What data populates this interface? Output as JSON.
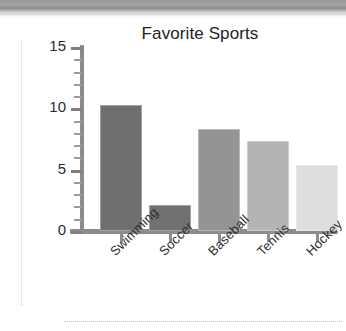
{
  "page": {
    "background_color": "#ffffff",
    "scan_band_color": "#9b9b9b"
  },
  "chart_data": {
    "type": "bar",
    "title": "Favorite Sports",
    "xlabel": "",
    "ylabel": "",
    "categories": [
      "Swimming",
      "Soccer",
      "Baseball",
      "Tennis",
      "Hockey"
    ],
    "values": [
      10.3,
      2.1,
      8.3,
      7.3,
      5.4
    ],
    "ylim": [
      0,
      15
    ],
    "yticks": [
      0,
      5,
      10,
      15
    ],
    "ytick_labels": [
      "0",
      "5",
      "10",
      "15"
    ],
    "yminor_tick_step": 1,
    "grid": false,
    "legend": false,
    "xtick_label_rotation": -45,
    "bar_colors": [
      "#6f6f6f",
      "#717171",
      "#949494",
      "#b4b4b4",
      "#dedede"
    ]
  },
  "axis": {
    "tick_0": "0",
    "tick_5": "5",
    "tick_10": "10",
    "tick_15": "15"
  }
}
